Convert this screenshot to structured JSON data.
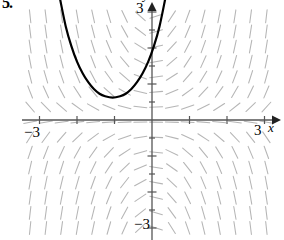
{
  "figure": {
    "problem_number": "5.",
    "type": "slope-field-with-solution-curve"
  },
  "axes": {
    "x_axis_label": "x",
    "y_axis_label": "y",
    "x_tick_left_label": "−3",
    "x_tick_right_label": "3",
    "y_tick_top_label": "3",
    "y_tick_bottom_label": "−3",
    "x_range": [
      -3.6,
      3.6
    ],
    "y_range": [
      -3.3,
      3.3
    ],
    "tick_values_x": [
      -3,
      -2,
      -1,
      1,
      2,
      3
    ],
    "tick_values_y": [
      -3,
      -2,
      -1,
      1,
      2,
      3
    ],
    "axis_color": "#555555",
    "arrow_x": "right",
    "arrow_y": "up"
  },
  "chart_data": {
    "type": "line",
    "title": "",
    "xlabel": "x",
    "ylabel": "y",
    "xlim": [
      -3.6,
      3.6
    ],
    "ylim": [
      -3.3,
      3.3
    ],
    "grid": false,
    "legend": "none",
    "slope_field": {
      "description": "direction field of dy/dx, short tick segments on a half-unit grid",
      "x_start": -3.25,
      "x_end": 3.25,
      "y_start": -3.0,
      "y_end": 3.1,
      "step": 0.42,
      "segment_length_px": 13,
      "color": "#a9a9a9",
      "slope_formula": "xy"
    },
    "solution_curve": {
      "name": "solution curve",
      "color": "#000000",
      "width_px": 2.2,
      "shape": "upward parabola-like U",
      "vertex": [
        -1.05,
        0.62
      ],
      "points_xy": [
        [
          -2.45,
          3.35
        ],
        [
          -2.3,
          2.6
        ],
        [
          -2.15,
          2.05
        ],
        [
          -2.0,
          1.62
        ],
        [
          -1.85,
          1.3
        ],
        [
          -1.7,
          1.05
        ],
        [
          -1.55,
          0.86
        ],
        [
          -1.4,
          0.73
        ],
        [
          -1.25,
          0.66
        ],
        [
          -1.05,
          0.62
        ],
        [
          -0.85,
          0.66
        ],
        [
          -0.7,
          0.73
        ],
        [
          -0.55,
          0.86
        ],
        [
          -0.4,
          1.05
        ],
        [
          -0.25,
          1.3
        ],
        [
          -0.1,
          1.62
        ],
        [
          0.05,
          2.05
        ],
        [
          0.2,
          2.6
        ],
        [
          0.35,
          3.35
        ]
      ]
    }
  }
}
